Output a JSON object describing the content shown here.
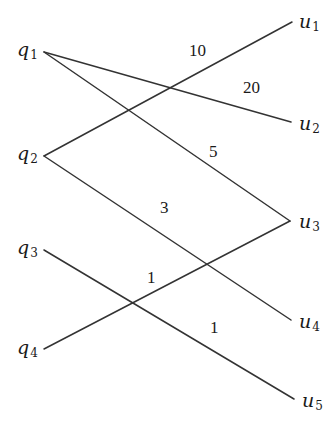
{
  "diagram": {
    "type": "bipartite-graph",
    "style": {
      "line_color": "#333333",
      "background": "#ffffff"
    },
    "left_nodes": [
      {
        "id": "q1",
        "symbol": "q",
        "sub": "1",
        "x": 44,
        "y": 52,
        "label_x": 17,
        "label_y": 40
      },
      {
        "id": "q2",
        "symbol": "q",
        "sub": "2",
        "x": 44,
        "y": 156,
        "label_x": 17,
        "label_y": 144
      },
      {
        "id": "q3",
        "symbol": "q",
        "sub": "3",
        "x": 44,
        "y": 250,
        "label_x": 17,
        "label_y": 238
      },
      {
        "id": "q4",
        "symbol": "q",
        "sub": "4",
        "x": 44,
        "y": 349,
        "label_x": 17,
        "label_y": 338
      }
    ],
    "right_nodes": [
      {
        "id": "u1",
        "symbol": "u",
        "sub": "1",
        "x": 292,
        "y": 22,
        "label_x": 299,
        "label_y": 12
      },
      {
        "id": "u2",
        "symbol": "u",
        "sub": "2",
        "x": 291,
        "y": 122,
        "label_x": 299,
        "label_y": 114
      },
      {
        "id": "u3",
        "symbol": "u",
        "sub": "3",
        "x": 290,
        "y": 221,
        "label_x": 299,
        "label_y": 212
      },
      {
        "id": "u4",
        "symbol": "u",
        "sub": "4",
        "x": 291,
        "y": 320,
        "label_x": 299,
        "label_y": 312
      },
      {
        "id": "u5",
        "symbol": "u",
        "sub": "5",
        "x": 294,
        "y": 399,
        "label_x": 302,
        "label_y": 391
      }
    ],
    "edges": [
      {
        "from": "q1",
        "to": "u2",
        "weight": "20",
        "x1": 44,
        "y1": 52,
        "x2": 291,
        "y2": 122,
        "label_x": 243,
        "label_y": 79
      },
      {
        "from": "q1",
        "to": "u3",
        "weight": "5",
        "x1": 44,
        "y1": 52,
        "x2": 290,
        "y2": 221,
        "label_x": 209,
        "label_y": 143
      },
      {
        "from": "q2",
        "to": "u1",
        "weight": "10",
        "x1": 44,
        "y1": 156,
        "x2": 292,
        "y2": 22,
        "label_x": 189,
        "label_y": 42
      },
      {
        "from": "q2",
        "to": "u4",
        "weight": "3",
        "x1": 44,
        "y1": 156,
        "x2": 291,
        "y2": 320,
        "label_x": 160,
        "label_y": 199
      },
      {
        "from": "q3",
        "to": "u5",
        "weight": "1",
        "x1": 44,
        "y1": 250,
        "x2": 294,
        "y2": 399,
        "label_x": 210,
        "label_y": 319
      },
      {
        "from": "q4",
        "to": "u3",
        "weight": "1",
        "x1": 44,
        "y1": 349,
        "x2": 290,
        "y2": 221,
        "label_x": 147,
        "label_y": 269
      }
    ]
  }
}
